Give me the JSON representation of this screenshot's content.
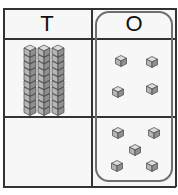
{
  "table": {
    "headers": [
      {
        "label": "T",
        "meaning": "tens"
      },
      {
        "label": "O",
        "meaning": "ones"
      }
    ],
    "rows": [
      {
        "tens_rods": 3,
        "ones_cubes": 4
      },
      {
        "tens_rods": 0,
        "ones_cubes": 5
      }
    ],
    "ones_column_highlighted": true
  },
  "colors": {
    "grid_line": "#333333",
    "highlight_border": "#6e6e6e",
    "cube_fill": "#b5b5b5",
    "cube_top": "#dcdcdc",
    "cube_side": "#8f8f8f"
  }
}
